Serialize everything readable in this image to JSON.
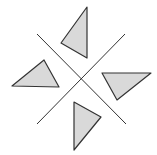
{
  "figure": {
    "width": 157,
    "height": 155,
    "background": "#ffffff",
    "stroke_color": "#333333",
    "fill_color": "#d9d9d9",
    "lines": [
      {
        "name": "diagonal-line-1",
        "x1": 37,
        "y1": 34,
        "x2": 126,
        "y2": 124
      },
      {
        "name": "diagonal-line-2",
        "x1": 125,
        "y1": 34,
        "x2": 37,
        "y2": 124
      }
    ],
    "triangles": [
      {
        "name": "top-triangle",
        "points": "87,7 61,43 87,58"
      },
      {
        "name": "left-triangle",
        "points": "12,86 44,60 59,87"
      },
      {
        "name": "right-triangle",
        "points": "102,73 151,73 117,100"
      },
      {
        "name": "bottom-triangle",
        "points": "74,102 101,117 74,150"
      }
    ]
  }
}
